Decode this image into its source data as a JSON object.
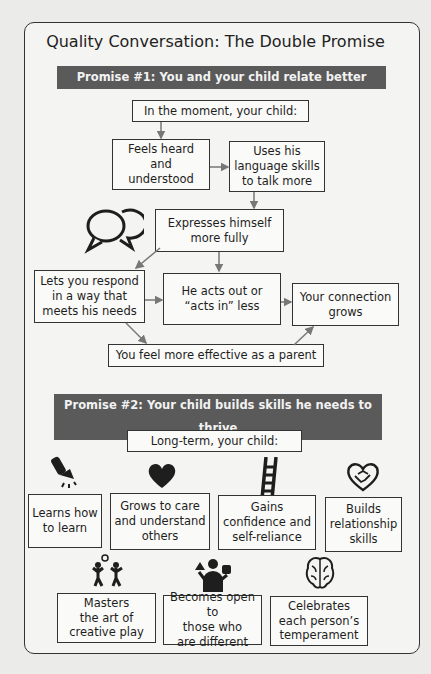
{
  "title": "Quality Conversation: The Double Promise",
  "promise1": {
    "banner": "Promise #1: You and your child relate better",
    "header": "In the moment, your child:",
    "nodes": {
      "feels_heard": "Feels heard\nand\nunderstood",
      "uses_language": "Uses his\nlanguage skills\nto talk more",
      "expresses": "Expresses himself\nmore fully",
      "lets_respond": "Lets you respond\nin a way that\nmeets his needs",
      "acts_out": "He acts out or\n“acts in” less",
      "connection": "Your connection\ngrows",
      "effective": "You feel more effective as a parent"
    },
    "icon": "speech-bubbles-icon"
  },
  "promise2": {
    "banner": "Promise #2: Your child builds skills he needs to thrive",
    "header": "Long-term, your child:",
    "row1": [
      {
        "label": "Learns how\nto learn",
        "icon": "flashlight-icon"
      },
      {
        "label": "Grows to care\nand understand\nothers",
        "icon": "heart-icon"
      },
      {
        "label": "Gains\nconfidence and\nself-reliance",
        "icon": "ladder-icon"
      },
      {
        "label": "Builds\nrelationship\nskills",
        "icon": "handshake-heart-icon"
      }
    ],
    "row2": [
      {
        "label": "Masters\nthe art of\ncreative play",
        "icon": "children-playing-icon"
      },
      {
        "label": "Becomes open to\nthose who\nare different",
        "icon": "person-shapes-icon"
      },
      {
        "label": "Celebrates\neach person’s\ntemperament",
        "icon": "brain-icon"
      }
    ]
  }
}
